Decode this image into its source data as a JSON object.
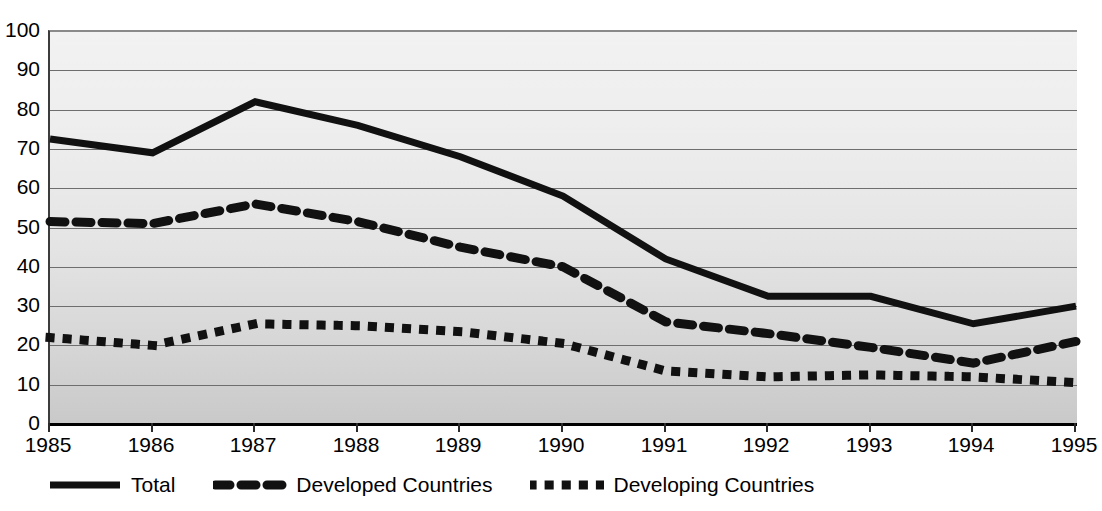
{
  "chart_data": {
    "type": "line",
    "title": "",
    "subtitle": "",
    "xlabel": "",
    "ylabel": "",
    "x": [
      1985,
      1986,
      1987,
      1988,
      1989,
      1990,
      1991,
      1992,
      1993,
      1994,
      1995
    ],
    "categories": [
      "1985",
      "1986",
      "1987",
      "1988",
      "1989",
      "1990",
      "1991",
      "1992",
      "1993",
      "1994",
      "1995"
    ],
    "xlim": [
      1985,
      1995
    ],
    "ylim": [
      0,
      100
    ],
    "y_ticks": [
      0,
      10,
      20,
      30,
      40,
      50,
      60,
      70,
      80,
      90,
      100
    ],
    "grid": true,
    "legend_position": "bottom-left",
    "series": [
      {
        "name": "Total",
        "style": "solid",
        "color": "#111111",
        "values": [
          72.5,
          69.0,
          82.0,
          76.0,
          68.0,
          58.0,
          42.0,
          32.5,
          32.5,
          25.5,
          30.0
        ]
      },
      {
        "name": "Developed Countries",
        "style": "dashed",
        "color": "#111111",
        "values": [
          51.5,
          51.0,
          56.0,
          51.5,
          45.0,
          40.0,
          26.0,
          23.0,
          19.5,
          15.5,
          21.0
        ]
      },
      {
        "name": "Developing Countries",
        "style": "dotted",
        "color": "#111111",
        "values": [
          22.0,
          20.0,
          25.5,
          25.0,
          23.5,
          20.5,
          13.5,
          12.0,
          12.5,
          12.0,
          10.5
        ]
      }
    ]
  },
  "axes": {
    "y_tick_labels": [
      "100",
      "90",
      "80",
      "70",
      "60",
      "50",
      "40",
      "30",
      "20",
      "10",
      "0"
    ],
    "x_tick_labels": [
      "1985",
      "1986",
      "1987",
      "1988",
      "1989",
      "1990",
      "1991",
      "1992",
      "1993",
      "1994",
      "1995"
    ]
  },
  "legend": {
    "items": [
      {
        "label": "Total",
        "style": "solid"
      },
      {
        "label": "Developed Countries",
        "style": "dashed"
      },
      {
        "label": "Developing Countries",
        "style": "dotted"
      }
    ]
  },
  "colors": {
    "series": "#111111",
    "gridline": "#6e6e6e",
    "axis": "#000000",
    "plot_background_top": "#f2f2f2",
    "plot_background_bottom": "#c9c9c9"
  }
}
